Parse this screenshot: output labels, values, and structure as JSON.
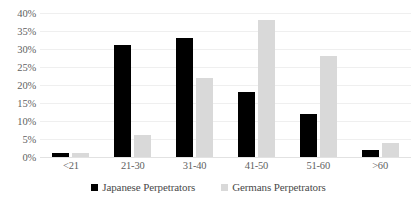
{
  "chart_data": {
    "type": "bar",
    "title": "",
    "subtitle": "",
    "xlabel": "",
    "ylabel": "",
    "categories": [
      "<21",
      "21-30",
      "31-40",
      "41-50",
      "51-60",
      ">60"
    ],
    "series": [
      {
        "name": "Japanese Perpetrators",
        "color": "#000000",
        "values": [
          1,
          31,
          33,
          18,
          12,
          2
        ]
      },
      {
        "name": "Germans Perpetrators",
        "color": "#D9D9D9",
        "values": [
          1,
          6,
          22,
          38,
          28,
          4
        ]
      }
    ],
    "ylim": [
      0,
      40
    ],
    "y_ticks": [
      "0%",
      "5%",
      "10%",
      "15%",
      "20%",
      "25%",
      "30%",
      "35%",
      "40%"
    ],
    "y_tick_values": [
      0,
      5,
      10,
      15,
      20,
      25,
      30,
      35,
      40
    ],
    "grid": true,
    "legend_position": "bottom"
  }
}
